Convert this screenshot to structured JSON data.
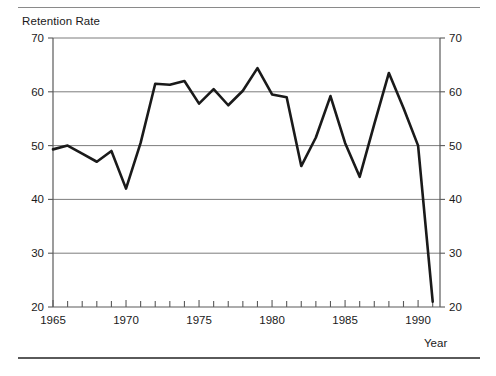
{
  "figure": {
    "top_rule": "horizontal-rule",
    "bottom_rule": "horizontal-rule"
  },
  "chart_data": {
    "type": "line",
    "title": "",
    "ylabel": "Retention Rate",
    "xlabel": "Year",
    "ylim": [
      20,
      70
    ],
    "xlim": [
      1965,
      1991.5
    ],
    "grid": true,
    "grid_axis": "y",
    "legend": false,
    "y_ticks": [
      20,
      30,
      40,
      50,
      60,
      70
    ],
    "y_ticks_right": [
      20,
      30,
      40,
      50,
      60,
      70
    ],
    "x_ticks_labeled": [
      1965,
      1970,
      1975,
      1980,
      1985,
      1990
    ],
    "x_ticks_minor": [
      1966,
      1967,
      1968,
      1969,
      1971,
      1972,
      1973,
      1974,
      1976,
      1977,
      1978,
      1979,
      1981,
      1982,
      1983,
      1984,
      1986,
      1987,
      1988,
      1989,
      1991
    ],
    "line_color": "#1a1a1a",
    "line_width": 2.6,
    "x": [
      1965,
      1966,
      1967,
      1968,
      1969,
      1970,
      1971,
      1972,
      1973,
      1974,
      1975,
      1976,
      1977,
      1978,
      1979,
      1980,
      1981,
      1982,
      1983,
      1984,
      1985,
      1986,
      1987,
      1988,
      1989,
      1990,
      1991
    ],
    "values": [
      49.3,
      50.0,
      48.5,
      47.0,
      49.0,
      42.0,
      50.5,
      61.5,
      61.3,
      62.0,
      57.8,
      60.5,
      57.5,
      60.2,
      64.4,
      59.5,
      59.0,
      46.2,
      51.5,
      59.2,
      50.5,
      44.2,
      54.0,
      63.5,
      57.0,
      50.0,
      21.0
    ]
  }
}
